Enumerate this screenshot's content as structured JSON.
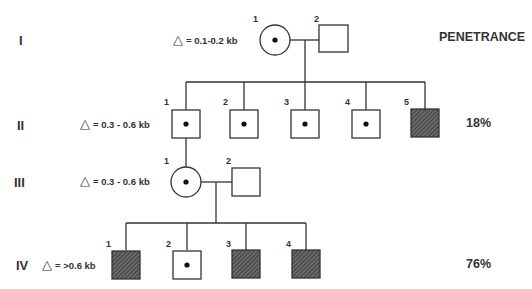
{
  "header": {
    "penetrance_label": "PENETRANCE"
  },
  "generations": [
    {
      "roman": "I",
      "delta_symbol": "△",
      "delta_text": "= 0.1-0.2 kb",
      "penetrance": ""
    },
    {
      "roman": "II",
      "delta_symbol": "△",
      "delta_text": "= 0.3 - 0.6 kb",
      "penetrance": "18%"
    },
    {
      "roman": "III",
      "delta_symbol": "△",
      "delta_text": "= 0.3 - 0.6 kb",
      "penetrance": ""
    },
    {
      "roman": "IV",
      "delta_symbol": "△",
      "delta_text": "= >0.6 kb",
      "penetrance": "76%"
    }
  ],
  "individuals": {
    "I": [
      {
        "n": "1",
        "sex": "female",
        "status": "carrier"
      },
      {
        "n": "2",
        "sex": "male",
        "status": "unaffected"
      }
    ],
    "II": [
      {
        "n": "1",
        "sex": "male",
        "status": "carrier"
      },
      {
        "n": "2",
        "sex": "male",
        "status": "carrier"
      },
      {
        "n": "3",
        "sex": "male",
        "status": "carrier"
      },
      {
        "n": "4",
        "sex": "male",
        "status": "carrier"
      },
      {
        "n": "5",
        "sex": "male",
        "status": "affected"
      }
    ],
    "III": [
      {
        "n": "1",
        "sex": "female",
        "status": "carrier"
      },
      {
        "n": "2",
        "sex": "male",
        "status": "unaffected"
      }
    ],
    "IV": [
      {
        "n": "1",
        "sex": "male",
        "status": "affected"
      },
      {
        "n": "2",
        "sex": "male",
        "status": "carrier"
      },
      {
        "n": "3",
        "sex": "male",
        "status": "affected"
      },
      {
        "n": "4",
        "sex": "male",
        "status": "affected"
      }
    ]
  },
  "colors": {
    "line": "#333333",
    "affected_fill": "#555555",
    "dot": "#111111"
  }
}
